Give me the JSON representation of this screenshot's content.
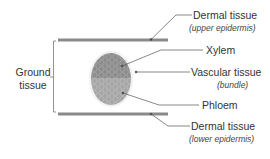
{
  "diagram": {
    "type": "leaf cross-section",
    "labels": {
      "upper_dermal": {
        "title": "Dermal tissue",
        "subtitle": "(upper epidermis)"
      },
      "xylem": {
        "title": "Xylem"
      },
      "vascular": {
        "title": "Vascular tissue",
        "subtitle": "(bundle)"
      },
      "phloem": {
        "title": "Phloem"
      },
      "lower_dermal": {
        "title": "Dermal tissue",
        "subtitle": "(lower epidermis)"
      },
      "ground": {
        "line1": "Ground",
        "line2": "tissue"
      }
    },
    "colors": {
      "epidermis": "#8a8a8a",
      "xylem": "#8c8c8c",
      "phloem": "#a6a6a6",
      "leader": "#555555",
      "bracket": "#777777"
    }
  }
}
